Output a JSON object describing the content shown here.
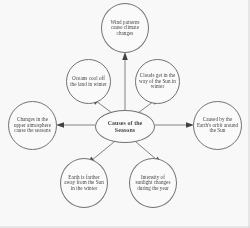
{
  "diagram": {
    "type": "concept-map",
    "title": "Causes of the Seasons",
    "center": {
      "id": "center",
      "label": "Causes of the Seasons"
    },
    "nodes": [
      {
        "id": "top",
        "label": "Wind patterns cause climate changes",
        "position": "top"
      },
      {
        "id": "upleft",
        "label": "Oceans cool off the land in winter",
        "position": "upper-left"
      },
      {
        "id": "upright",
        "label": "Clouds get in the way of the Sun in winter",
        "position": "upper-right"
      },
      {
        "id": "left",
        "label": "Changes in the upper atmosphere cause the seasons",
        "position": "left"
      },
      {
        "id": "right",
        "label": "Caused by the Earth's orbit around the Sun",
        "position": "right"
      },
      {
        "id": "botleft",
        "label": "Earth is farther away from the Sun in the winter",
        "position": "bottom-left"
      },
      {
        "id": "botright",
        "label": "Intensity of sunlight changes during the year",
        "position": "bottom-right"
      }
    ],
    "edges": [
      {
        "from": "center",
        "to": "top",
        "direction": "outward"
      },
      {
        "from": "center",
        "to": "upleft",
        "direction": "outward"
      },
      {
        "from": "center",
        "to": "upright",
        "direction": "outward"
      },
      {
        "from": "center",
        "to": "left",
        "direction": "outward"
      },
      {
        "from": "center",
        "to": "right",
        "direction": "outward"
      },
      {
        "from": "center",
        "to": "botleft",
        "direction": "outward"
      },
      {
        "from": "center",
        "to": "botright",
        "direction": "outward"
      }
    ],
    "colors": {
      "node_outline": "#6f6f6f",
      "node_fill": "#ffffff",
      "text": "#3d3d3d",
      "edge": "#5f5f5f",
      "background": "#fdfdfd",
      "frame": "#d8d8d8"
    }
  }
}
